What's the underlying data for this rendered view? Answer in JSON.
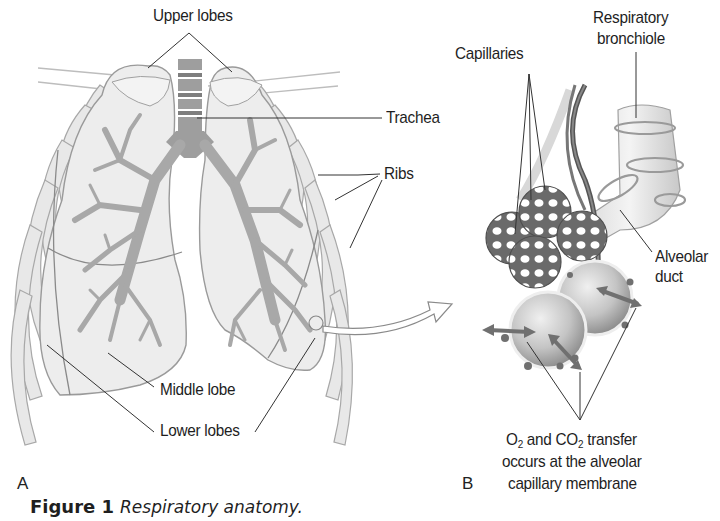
{
  "figure": {
    "number_label": "Figure 1",
    "title": "Respiratory anatomy."
  },
  "panels": {
    "a": {
      "label": "A",
      "description": "Frontal view of lungs with bronchial tree and ribs",
      "labels": {
        "upper_lobes": "Upper lobes",
        "trachea": "Trachea",
        "ribs": "Ribs",
        "middle_lobe": "Middle lobe",
        "lower_lobes": "Lower lobes"
      }
    },
    "b": {
      "label": "B",
      "description": "Magnified alveolar sac with capillary network",
      "labels": {
        "capillaries": "Capillaries",
        "respiratory_bronchiole_line1": "Respiratory",
        "respiratory_bronchiole_line2": "bronchiole",
        "alveolar_duct_line1": "Alveolar",
        "alveolar_duct_line2": "duct",
        "gas_exchange_o2": "O",
        "gas_exchange_sub1": "2",
        "gas_exchange_and": " and CO",
        "gas_exchange_sub2": "2",
        "gas_exchange_rest": " transfer",
        "gas_exchange_line2": "occurs at the alveolar",
        "gas_exchange_line3": "capillary membrane"
      }
    }
  },
  "colors": {
    "lung_fill": "#ececec",
    "lung_outline": "#9a9a9a",
    "bronchi": "#a8a8a8",
    "trachea": "#9c9c9c",
    "leader_line": "#333333",
    "capillary": "#6e6e6e",
    "alveolus": "#c9c9c9"
  }
}
